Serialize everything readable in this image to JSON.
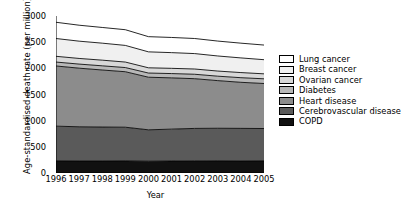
{
  "chart_data": {
    "type": "area",
    "stacked": true,
    "title": "",
    "xlabel": "Year",
    "ylabel": "Age-standardised death rate (per million)",
    "x": [
      1996,
      1997,
      1998,
      1999,
      2000,
      2001,
      2002,
      2003,
      2004,
      2005
    ],
    "xticklabels": [
      "1996",
      "1997",
      "1998",
      "1999",
      "2000",
      "2001",
      "2002",
      "2003",
      "2004",
      "2005"
    ],
    "yticks": [
      0,
      500,
      1000,
      1500,
      2000,
      2500,
      3000
    ],
    "yticklabels": [
      "0",
      "500",
      "1000",
      "1500",
      "2000",
      "2500",
      "3000"
    ],
    "ylim": [
      0,
      3000
    ],
    "xlim": [
      1996,
      2005
    ],
    "grid": false,
    "legend_position": "right",
    "series": [
      {
        "name": "COPD",
        "color": "#111111",
        "values": [
          230,
          228,
          228,
          230,
          225,
          228,
          232,
          230,
          228,
          230
        ]
      },
      {
        "name": "Cerebrovascular disease",
        "color": "#5a5a5a",
        "values": [
          665,
          655,
          650,
          645,
          600,
          610,
          620,
          625,
          625,
          620
        ]
      },
      {
        "name": "Heart disease",
        "color": "#8c8c8c",
        "values": [
          1150,
          1120,
          1090,
          1060,
          1005,
          980,
          950,
          910,
          880,
          860
        ]
      },
      {
        "name": "Diabetes",
        "color": "#b8b8b8",
        "values": [
          75,
          78,
          80,
          80,
          80,
          82,
          85,
          85,
          88,
          90
        ]
      },
      {
        "name": "Ovarian cancer",
        "color": "#d8d8d8",
        "values": [
          110,
          108,
          108,
          105,
          100,
          100,
          100,
          98,
          98,
          95
        ]
      },
      {
        "name": "Breast cancer",
        "color": "#f0f0f0",
        "values": [
          340,
          330,
          325,
          318,
          305,
          300,
          295,
          288,
          280,
          270
        ]
      },
      {
        "name": "Lung cancer",
        "color": "#ffffff",
        "values": [
          310,
          305,
          300,
          300,
          290,
          290,
          288,
          285,
          282,
          280
        ]
      }
    ],
    "totals": [
      2880,
      2824,
      2781,
      2738,
      2605,
      2590,
      2570,
      2521,
      2481,
      2445
    ]
  },
  "legend": {
    "items": [
      {
        "label": "Lung cancer",
        "color": "#ffffff"
      },
      {
        "label": "Breast cancer",
        "color": "#f0f0f0"
      },
      {
        "label": "Ovarian cancer",
        "color": "#d8d8d8"
      },
      {
        "label": "Diabetes",
        "color": "#b8b8b8"
      },
      {
        "label": "Heart disease",
        "color": "#8c8c8c"
      },
      {
        "label": "Cerebrovascular disease",
        "color": "#5a5a5a"
      },
      {
        "label": "COPD",
        "color": "#111111"
      }
    ]
  }
}
